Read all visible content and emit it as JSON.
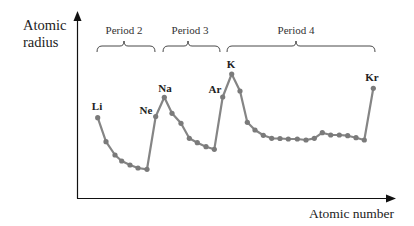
{
  "chart_data": {
    "type": "line",
    "title": "",
    "xlabel": "Atomic number",
    "ylabel": "Atomic radius",
    "grid": false,
    "legend": null,
    "axis_ticks": false,
    "x": [
      3,
      4,
      5,
      6,
      7,
      8,
      9,
      10,
      11,
      12,
      13,
      14,
      15,
      16,
      17,
      18,
      19,
      20,
      21,
      22,
      23,
      24,
      25,
      26,
      27,
      28,
      29,
      30,
      31,
      32,
      33,
      34,
      35,
      36
    ],
    "elements": [
      "Li",
      "Be",
      "B",
      "C",
      "N",
      "O",
      "F",
      "Ne",
      "Na",
      "Mg",
      "Al",
      "Si",
      "P",
      "S",
      "Cl",
      "Ar",
      "K",
      "Ca",
      "Sc",
      "Ti",
      "V",
      "Cr",
      "Mn",
      "Fe",
      "Co",
      "Ni",
      "Cu",
      "Zn",
      "Ga",
      "Ge",
      "As",
      "Se",
      "Br",
      "Kr"
    ],
    "values_relative": [
      0.43,
      0.3,
      0.23,
      0.19,
      0.17,
      0.16,
      0.155,
      0.43,
      0.54,
      0.45,
      0.4,
      0.32,
      0.295,
      0.275,
      0.26,
      0.54,
      0.67,
      0.57,
      0.41,
      0.37,
      0.34,
      0.32,
      0.32,
      0.32,
      0.315,
      0.315,
      0.31,
      0.32,
      0.35,
      0.34,
      0.34,
      0.335,
      0.325,
      0.31,
      0.595
    ],
    "series": [
      {
        "name": "Atomic radius",
        "color": "#808080",
        "points_px": [
          [
            97.7,
            117.7
          ],
          [
            106,
            141.7
          ],
          [
            115,
            155
          ],
          [
            121.7,
            161
          ],
          [
            130,
            165
          ],
          [
            138,
            168
          ],
          [
            147,
            169.3
          ],
          [
            155.7,
            116.5
          ],
          [
            164.3,
            97.3
          ],
          [
            172,
            113.3
          ],
          [
            181,
            123.3
          ],
          [
            189.3,
            138.3
          ],
          [
            197.3,
            142.7
          ],
          [
            206,
            146.7
          ],
          [
            214.3,
            149.3
          ],
          [
            222.7,
            97
          ],
          [
            231.7,
            74
          ],
          [
            240,
            91
          ],
          [
            247.3,
            122.3
          ],
          [
            255,
            130
          ],
          [
            263.3,
            135.3
          ],
          [
            271.7,
            138.3
          ],
          [
            280,
            138.5
          ],
          [
            288.3,
            139
          ],
          [
            297.3,
            139
          ],
          [
            306,
            140
          ],
          [
            314.3,
            138.3
          ],
          [
            322.3,
            132.7
          ],
          [
            330.7,
            135
          ],
          [
            339.3,
            135
          ],
          [
            347.7,
            135.7
          ],
          [
            356,
            137.7
          ],
          [
            364.3,
            140
          ],
          [
            373.3,
            88.3
          ]
        ]
      }
    ],
    "annotations": [
      {
        "text": "Li",
        "x": 97,
        "y": 100
      },
      {
        "text": "Ne",
        "x": 147,
        "y": 105
      },
      {
        "text": "Na",
        "x": 165,
        "y": 83
      },
      {
        "text": "Ar",
        "x": 215,
        "y": 84
      },
      {
        "text": "K",
        "x": 231,
        "y": 59
      },
      {
        "text": "Kr",
        "x": 372,
        "y": 72
      }
    ],
    "period_groups": [
      {
        "label": "Period 2",
        "from": "Li",
        "to": "Ne",
        "x1": 97,
        "x2": 155,
        "tip": 124
      },
      {
        "label": "Period 3",
        "from": "Na",
        "to": "Ar",
        "x1": 163,
        "x2": 220,
        "tip": 188
      },
      {
        "label": "Period 4",
        "from": "K",
        "to": "Kr",
        "x1": 227,
        "x2": 375,
        "tip": 296
      }
    ]
  },
  "labels": {
    "y_axis": [
      "Atomic",
      "radius"
    ],
    "x_axis": "Atomic number",
    "periods": [
      "Period 2",
      "Period 3",
      "Period 4"
    ],
    "elements": {
      "li": "Li",
      "ne": "Ne",
      "na": "Na",
      "ar": "Ar",
      "k": "K",
      "kr": "Kr"
    }
  },
  "colors": {
    "line": "#858585",
    "marker": "#7a7a7a",
    "axis": "#111111",
    "text": "#222222"
  }
}
